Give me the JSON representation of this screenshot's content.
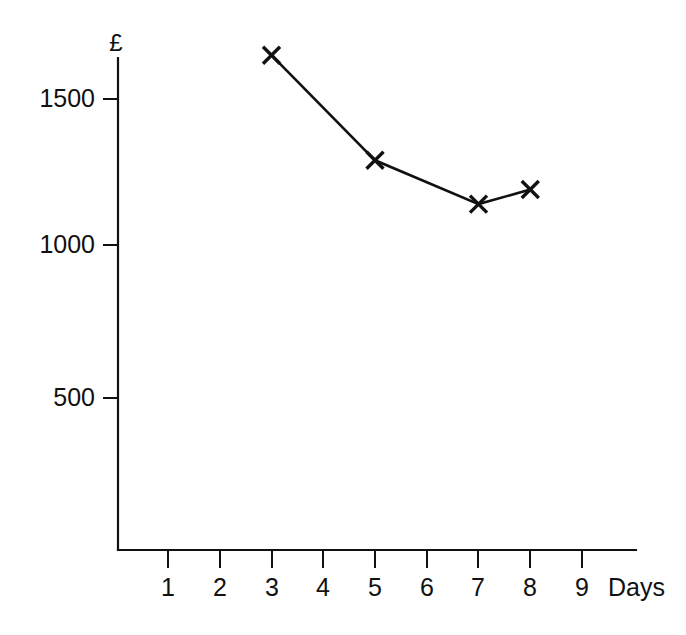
{
  "chart_data": {
    "type": "line",
    "title": "",
    "subtitle": "",
    "xlabel": "Days",
    "ylabel": "£",
    "x": [
      3,
      5,
      7,
      8
    ],
    "values": [
      1650,
      1290,
      1140,
      1190
    ],
    "series": [
      {
        "name": "",
        "x": [
          3,
          5,
          7,
          8
        ],
        "values": [
          1650,
          1290,
          1140,
          1190
        ]
      }
    ],
    "xtick_labels": [
      "1",
      "2",
      "3",
      "4",
      "5",
      "6",
      "7",
      "8",
      "9"
    ],
    "xticks": [
      1,
      2,
      3,
      4,
      5,
      6,
      7,
      8,
      9
    ],
    "ytick_labels": [
      "500",
      "1000",
      "1500"
    ],
    "yticks": [
      500,
      1000,
      1500
    ],
    "xlim": [
      0.45,
      9.6
    ],
    "ylim": [
      0,
      1800
    ],
    "grid": false,
    "legend": false,
    "legend_position": "none",
    "marker": "x",
    "line_color": "#111111",
    "marker_color": "#111111",
    "background_color": "#ffffff"
  },
  "axes": {
    "y_axis_label": "£",
    "x_axis_label": "Days",
    "y_tick_1": "1500",
    "y_tick_2": "1000",
    "y_tick_3": "500",
    "x_tick_1": "1",
    "x_tick_2": "2",
    "x_tick_3": "3",
    "x_tick_4": "4",
    "x_tick_5": "5",
    "x_tick_6": "6",
    "x_tick_7": "7",
    "x_tick_8": "8",
    "x_tick_9": "9"
  }
}
